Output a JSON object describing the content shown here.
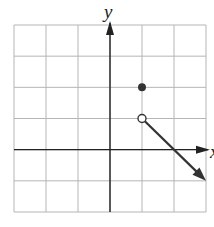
{
  "chart_data": {
    "type": "line",
    "title": "",
    "xlabel": "x",
    "ylabel": "y",
    "xlim": [
      -3,
      3
    ],
    "ylim": [
      -2,
      4
    ],
    "grid": true,
    "grid_step": 1,
    "points": [
      {
        "x": 1,
        "y": 2,
        "style": "filled"
      },
      {
        "x": 1,
        "y": 1,
        "style": "open"
      }
    ],
    "series": [
      {
        "name": "ray",
        "x": [
          1,
          3
        ],
        "y": [
          1,
          -1
        ],
        "start": "open",
        "end": "arrow"
      }
    ],
    "annotations": []
  },
  "labels": {
    "y_axis": "y",
    "x_axis": "x"
  },
  "colors": {
    "grid": "#b5b5b5",
    "axis": "#222222",
    "graph": "#333333"
  }
}
